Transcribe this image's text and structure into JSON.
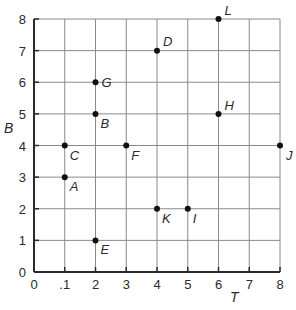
{
  "chart_data": {
    "type": "scatter",
    "title": "",
    "xlabel": "T",
    "ylabel": "B",
    "xlim": [
      0,
      8
    ],
    "ylim": [
      0,
      8
    ],
    "grid": true,
    "legend": null,
    "x_ticks": [
      "0",
      ".1",
      "2",
      "3",
      "4",
      "5",
      "6",
      "7",
      "8"
    ],
    "y_ticks": [
      "0",
      "1",
      "2",
      "3",
      "4",
      "5",
      "6",
      "7",
      "8"
    ],
    "points": [
      {
        "label": "A",
        "x": 1,
        "y": 3
      },
      {
        "label": "B",
        "x": 2,
        "y": 5
      },
      {
        "label": "C",
        "x": 1,
        "y": 4
      },
      {
        "label": "D",
        "x": 4,
        "y": 7
      },
      {
        "label": "E",
        "x": 2,
        "y": 1
      },
      {
        "label": "F",
        "x": 3,
        "y": 4
      },
      {
        "label": "G",
        "x": 2,
        "y": 6
      },
      {
        "label": "H",
        "x": 6,
        "y": 5
      },
      {
        "label": "I",
        "x": 5,
        "y": 2
      },
      {
        "label": "J",
        "x": 8,
        "y": 4
      },
      {
        "label": "K",
        "x": 4,
        "y": 2
      },
      {
        "label": "L",
        "x": 6,
        "y": 8
      }
    ],
    "label_offsets": {
      "A": [
        5,
        14
      ],
      "B": [
        5,
        14
      ],
      "C": [
        5,
        14
      ],
      "D": [
        6,
        -5
      ],
      "E": [
        5,
        14
      ],
      "F": [
        5,
        14
      ],
      "G": [
        6,
        5
      ],
      "H": [
        6,
        -4
      ],
      "I": [
        5,
        14
      ],
      "J": [
        6,
        14
      ],
      "K": [
        5,
        14
      ],
      "L": [
        6,
        -4
      ]
    }
  },
  "colors": {
    "axis": "#2a2a2a",
    "grid": "#8a8a8a",
    "point": "#111111"
  }
}
